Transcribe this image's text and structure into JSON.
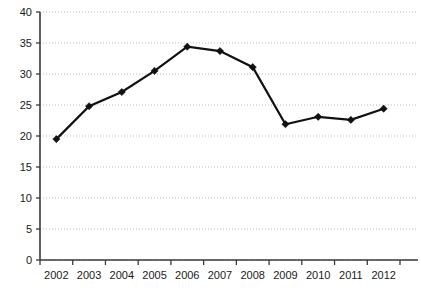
{
  "chart_data": {
    "type": "line",
    "title": "",
    "subtitle": "",
    "xlabel": "",
    "ylabel": "",
    "categories": [
      "2002",
      "2003",
      "2004",
      "2005",
      "2006",
      "2007",
      "2008",
      "2009",
      "2010",
      "2011",
      "2012"
    ],
    "values": [
      19.5,
      24.8,
      27.1,
      30.5,
      34.4,
      33.7,
      31.1,
      21.9,
      23.1,
      22.6,
      24.4
    ],
    "series": [
      {
        "name": "",
        "values": [
          19.5,
          24.8,
          27.1,
          30.5,
          34.4,
          33.7,
          31.1,
          21.9,
          23.1,
          22.6,
          24.4
        ],
        "color": "#111111",
        "marker": "diamond"
      }
    ],
    "ylim": [
      0,
      40
    ],
    "yticks": [
      0,
      5,
      10,
      15,
      20,
      25,
      30,
      35,
      40
    ],
    "ytick_labels": [
      "0",
      "5",
      "10",
      "15",
      "20",
      "25",
      "30",
      "35",
      "40"
    ],
    "xtick_labels": [
      "2002",
      "2003",
      "2004",
      "2005",
      "2006",
      "2007",
      "2008",
      "2009",
      "2010",
      "2011",
      "2012"
    ],
    "grid": {
      "horizontal": true,
      "vertical": false,
      "style": "dotted",
      "color": "#b9b9b9"
    },
    "legend": {
      "visible": false,
      "position": "none",
      "entries": []
    },
    "annotations": [],
    "axis_color": "#3a3a3a",
    "background": "#ffffff"
  },
  "layout": {
    "plot_left": 40,
    "plot_right": 400,
    "plot_top": 12,
    "plot_bottom": 260,
    "width": 421,
    "height": 291
  }
}
